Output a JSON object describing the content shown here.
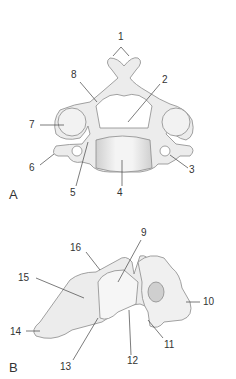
{
  "figure": {
    "panels": [
      {
        "id": "A",
        "label": "A",
        "view": "superior view of cervical vertebra",
        "callouts": [
          {
            "number": "1"
          },
          {
            "number": "2"
          },
          {
            "number": "3"
          },
          {
            "number": "4"
          },
          {
            "number": "5"
          },
          {
            "number": "6"
          },
          {
            "number": "7"
          },
          {
            "number": "8"
          }
        ]
      },
      {
        "id": "B",
        "label": "B",
        "view": "lateral view of cervical vertebra",
        "callouts": [
          {
            "number": "9"
          },
          {
            "number": "10"
          },
          {
            "number": "11"
          },
          {
            "number": "12"
          },
          {
            "number": "13"
          },
          {
            "number": "14"
          },
          {
            "number": "15"
          },
          {
            "number": "16"
          }
        ]
      }
    ],
    "colors": {
      "bone": "#ececec",
      "bone_shade": "#c8c8c8",
      "outline": "#8a8a8a",
      "text": "#333333"
    }
  }
}
